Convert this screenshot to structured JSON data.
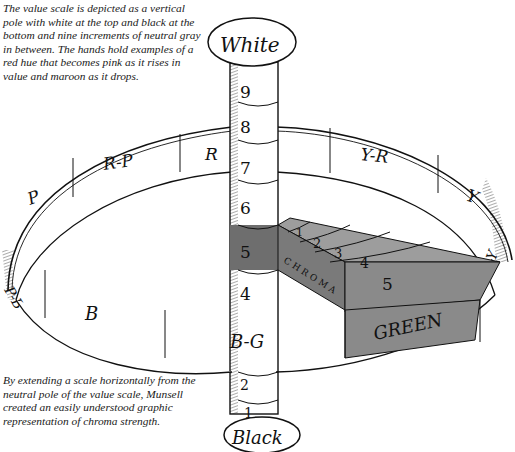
{
  "captions": {
    "top": "The value scale is depicted as a vertical pole with white at the top and black at the bottom and nine increments of neutral gray in between. The hands hold examples of a red hue that becomes pink as it rises in value and maroon as it drops.",
    "bottom": "By extending a scale horizontally from the neutral pole of the value scale, Munsell created an easily understood graphic representation of chroma strength."
  },
  "pole": {
    "top_cap": "White",
    "bottom_cap": "Black",
    "values": [
      "9",
      "8",
      "7",
      "6",
      "5",
      "4",
      "3",
      "2",
      "1"
    ]
  },
  "hue_ring": {
    "segments": [
      "P",
      "R-P",
      "R",
      "Y-R",
      "Y",
      "G-Y",
      "GREEN",
      "B-G",
      "B",
      "P-B"
    ]
  },
  "chroma_arm": {
    "label": "CHROMA",
    "steps": [
      "1",
      "2",
      "3",
      "4",
      "5"
    ],
    "end_label": "GREEN"
  },
  "colors": {
    "ink": "#111111",
    "gray_dark": "#6e6e6e",
    "gray_mid": "#8a8a8a",
    "gray_light": "#9d9d9d",
    "paper": "#ffffff"
  }
}
